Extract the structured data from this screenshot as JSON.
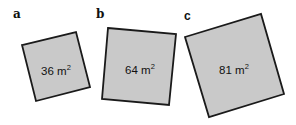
{
  "figure": {
    "panels": [
      {
        "id": "a",
        "label": "a",
        "area_value": "36",
        "area_unit": "m",
        "area_exponent": "2",
        "corners": [
          [
            22,
            45
          ],
          [
            76,
            32
          ],
          [
            90,
            87
          ],
          [
            36,
            101
          ]
        ],
        "label_pos": [
          13,
          18
        ],
        "text_pos": [
          56,
          75
        ]
      },
      {
        "id": "b",
        "label": "b",
        "area_value": "64",
        "area_unit": "m",
        "area_exponent": "2",
        "corners": [
          [
            108,
            28
          ],
          [
            176,
            34
          ],
          [
            169,
            105
          ],
          [
            102,
            99
          ]
        ],
        "label_pos": [
          96,
          18
        ],
        "text_pos": [
          140,
          74
        ]
      },
      {
        "id": "c",
        "label": "c",
        "area_value": "81",
        "area_unit": "m",
        "area_exponent": "2",
        "corners": [
          [
            185,
            37
          ],
          [
            261,
            14
          ],
          [
            284,
            94
          ],
          [
            209,
            117
          ]
        ],
        "label_pos": [
          184,
          20
        ],
        "text_pos": [
          234,
          74
        ]
      }
    ],
    "colors": {
      "fill": "#c9c9c9",
      "stroke": "#1a1a1a",
      "text": "#111111",
      "background": "#ffffff"
    }
  }
}
